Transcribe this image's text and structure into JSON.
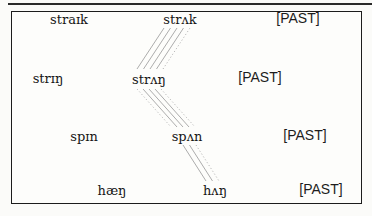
{
  "figure": {
    "rows": [
      {
        "present": "straɪk",
        "past": "strʌk",
        "feature": "[PAST]"
      },
      {
        "present": "strɪŋ",
        "past": "strʌŋ",
        "feature": "[PAST]"
      },
      {
        "present": "spɪn",
        "past": "spʌn",
        "feature": "[PAST]"
      },
      {
        "present": "hæŋ",
        "past": "hʌŋ",
        "feature": "[PAST]"
      }
    ],
    "connections": [
      {
        "from": "strʌk",
        "to": "strʌŋ",
        "lines": 5,
        "style": "parallel solid + dotted"
      },
      {
        "from": "strʌŋ",
        "to": "spʌn",
        "lines": 5,
        "style": "parallel solid + dotted"
      },
      {
        "from": "spʌn",
        "to": "hʌŋ",
        "lines": 3,
        "style": "parallel solid + dotted"
      }
    ],
    "colors": {
      "frame_border": "#1c1c1c",
      "top_rule": "#2a2a2a",
      "connection_line_solid": "#a3a3a3",
      "connection_line_dotted": "#b0b0b0",
      "background": "#fbfbf9"
    }
  }
}
